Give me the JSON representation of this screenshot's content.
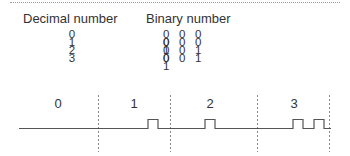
{
  "figure": {
    "headers": {
      "decimal": "Decimal number",
      "binary": "Binary number"
    },
    "table": {
      "rows": [
        {
          "decimal": "0",
          "binary": "0 0 0 0"
        },
        {
          "decimal": "1",
          "binary": "0 0 0 1"
        },
        {
          "decimal": "2",
          "binary": "0 0 1 0"
        },
        {
          "decimal": "3",
          "binary": "0 0 1 1"
        }
      ]
    },
    "waveform": {
      "slots": [
        {
          "label": "0",
          "pulses": 0
        },
        {
          "label": "1",
          "pulses": 1
        },
        {
          "label": "2",
          "pulses": 1
        },
        {
          "label": "3",
          "pulses": 2
        }
      ],
      "line_color": "#555555",
      "divider_color": "#888888"
    }
  }
}
